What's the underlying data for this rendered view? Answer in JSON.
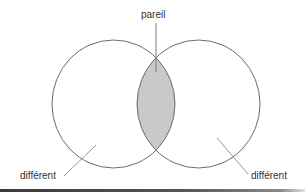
{
  "diagram": {
    "type": "venn",
    "sets": [
      {
        "id": "left",
        "label": "différent"
      },
      {
        "id": "right",
        "label": "différent"
      }
    ],
    "intersection": {
      "label": "pareil"
    },
    "labels": {
      "top": "pareil",
      "left": "différent",
      "right": "différent"
    },
    "colors": {
      "stroke": "#6b6b6b",
      "intersection_fill": "#c9c9c9",
      "leader": "#7a7a7a",
      "text": "#333333",
      "bottom_rule": "#3a3a3a"
    }
  }
}
